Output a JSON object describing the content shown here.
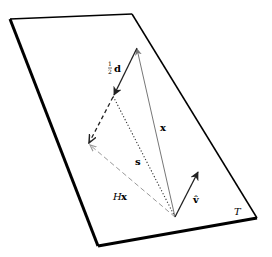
{
  "diagram": {
    "plane_label": "T",
    "labels": {
      "half_d_num": "1",
      "half_d_den": "2",
      "half_d_vec": "d",
      "x": "x",
      "s": "s",
      "Hx_H": "H",
      "Hx_x": "x",
      "v_hat": "v̂"
    },
    "colors": {
      "plane_edge": "#000000",
      "vector_black": "#222222",
      "vector_gray": "#777777",
      "dashed_gray": "#999999",
      "background": "#ffffff"
    },
    "geometry": {
      "plane": [
        [
          10,
          19
        ],
        [
          132,
          14
        ],
        [
          257,
          218
        ],
        [
          98,
          246
        ]
      ],
      "origin": [
        175,
        217
      ],
      "x_tip": [
        137,
        48
      ],
      "half_d_end": [
        113,
        96
      ],
      "dashed_corner": [
        88,
        144
      ],
      "v_hat_tip": [
        199,
        171
      ]
    }
  }
}
